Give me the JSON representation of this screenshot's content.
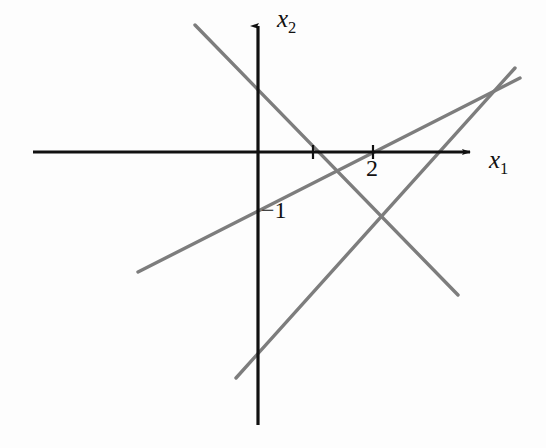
{
  "figure": {
    "background_color": "#fdfdfd",
    "axis_color": "#111111",
    "line_color": "#7d7d7d"
  },
  "labels": {
    "y_axis": {
      "base": "x",
      "sub": "2"
    },
    "x_axis": {
      "base": "x",
      "sub": "1"
    },
    "x_tick_two": "2",
    "y_intercept_minus_one": "−1"
  },
  "chart_data": {
    "type": "line",
    "title": "",
    "xlabel": "x₁",
    "ylabel": "x₂",
    "grid": false,
    "legend": null,
    "axes": {
      "origin_px": [
        258,
        153
      ],
      "x_axis_px": {
        "x_start": 33,
        "x_end": 478,
        "y": 152,
        "arrow": "right"
      },
      "y_axis_px": {
        "y_start": 18,
        "y_end": 425,
        "x": 258,
        "arrow": "up"
      },
      "unit_px": 57.5,
      "x_range_units": [
        -3.9,
        3.8
      ],
      "y_range_units": [
        -4.7,
        2.3
      ]
    },
    "ticks": {
      "x": [
        {
          "label": "",
          "value": 1,
          "px": 313
        },
        {
          "label": "2",
          "value": 2,
          "px": 373
        }
      ],
      "y": [
        {
          "label": "−1",
          "value": -1,
          "px": 207
        }
      ]
    },
    "series": [
      {
        "name": "line-descending",
        "start_px": [
          195,
          25
        ],
        "end_px": [
          458,
          295
        ],
        "x_intercept_units": 0.96,
        "slope_units": -1.03
      },
      {
        "name": "line-gentle-rising",
        "start_px": [
          138,
          272
        ],
        "end_px": [
          520,
          78
        ],
        "y_intercept_units": -1,
        "slope_units": 0.51
      },
      {
        "name": "line-steep-rising",
        "start_px": [
          236,
          378
        ],
        "end_px": [
          515,
          68
        ],
        "x_intercept_units": 3.03,
        "slope_units": 1.11
      }
    ],
    "intersections_px": [
      [
        378,
        212
      ],
      [
        497,
        85
      ],
      [
        432,
        152
      ],
      [
        313,
        152
      ]
    ]
  }
}
